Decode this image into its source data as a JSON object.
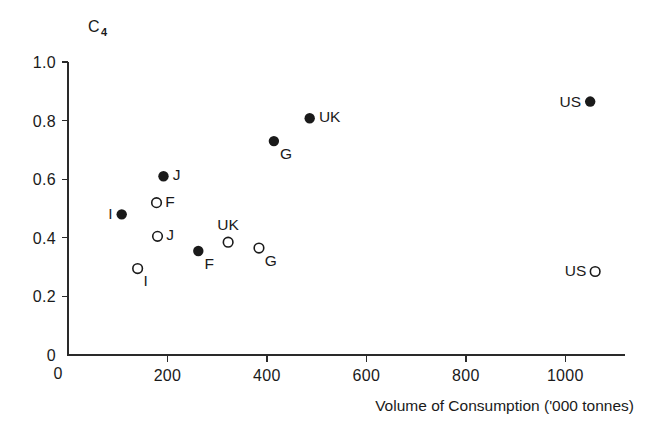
{
  "chart_data": {
    "type": "scatter",
    "title": "",
    "ylabel": "C",
    "ylabel_subscript": "4",
    "xlabel": "Volume of Consumption ('000 tonnes)",
    "xlim": [
      0,
      1120
    ],
    "ylim": [
      0,
      1.0
    ],
    "xticks": [
      0,
      200,
      400,
      600,
      800,
      1000
    ],
    "xticklabels": [
      "0",
      "200",
      "400",
      "600",
      "800",
      "1000"
    ],
    "yticks": [
      0,
      0.2,
      0.4,
      0.6,
      0.8,
      1.0
    ],
    "yticklabels": [
      "0",
      "0.2",
      "0.4",
      "0.6",
      "0.8",
      "1.0"
    ],
    "grid": false,
    "legend": "none",
    "series": [
      {
        "name": "filled",
        "marker": "filled-circle",
        "points": [
          {
            "label": "I",
            "x": 108,
            "y": 0.48,
            "label_pos": "left"
          },
          {
            "label": "J",
            "x": 192,
            "y": 0.61,
            "label_pos": "right"
          },
          {
            "label": "F",
            "x": 262,
            "y": 0.355,
            "label_pos": "below-right"
          },
          {
            "label": "G",
            "x": 414,
            "y": 0.73,
            "label_pos": "below-right"
          },
          {
            "label": "UK",
            "x": 486,
            "y": 0.808,
            "label_pos": "right"
          },
          {
            "label": "US",
            "x": 1050,
            "y": 0.865,
            "label_pos": "left"
          }
        ]
      },
      {
        "name": "open",
        "marker": "open-circle",
        "points": [
          {
            "label": "I",
            "x": 140,
            "y": 0.295,
            "label_pos": "below-right"
          },
          {
            "label": "J",
            "x": 180,
            "y": 0.405,
            "label_pos": "right"
          },
          {
            "label": "F",
            "x": 178,
            "y": 0.52,
            "label_pos": "right"
          },
          {
            "label": "UK",
            "x": 322,
            "y": 0.385,
            "label_pos": "above"
          },
          {
            "label": "G",
            "x": 384,
            "y": 0.365,
            "label_pos": "below-right"
          },
          {
            "label": "US",
            "x": 1060,
            "y": 0.285,
            "label_pos": "left"
          }
        ]
      }
    ]
  },
  "axes": {
    "y_axis_name": "C4",
    "x_axis_name": "Volume of Consumption ('000 tonnes)"
  }
}
